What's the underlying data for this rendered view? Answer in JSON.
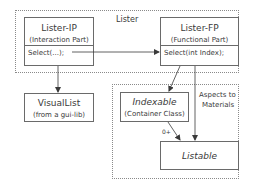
{
  "diagram": {
    "groups": [
      {
        "id": "lister",
        "label": "Lister"
      },
      {
        "id": "aspects",
        "label": "Aspects to Materials",
        "label_lines": [
          "Aspects to",
          "Materials"
        ]
      }
    ],
    "nodes": {
      "lister_ip": {
        "title": "Lister-IP",
        "subtitle": "(Interaction Part)",
        "method": "Select(...);"
      },
      "lister_fp": {
        "title": "Lister-FP",
        "subtitle": "(Functional Part)",
        "method": "Select(int Index);"
      },
      "visual_list": {
        "title": "VisualList",
        "subtitle": "(from a gui-lib)"
      },
      "indexable": {
        "title": "Indexable",
        "subtitle": "(Container Class)"
      },
      "listable": {
        "title": "Listable"
      }
    },
    "edges": [
      {
        "from": "lister_ip.Select(...)",
        "to": "lister_fp.Select(int Index)",
        "label": ""
      },
      {
        "from": "lister_ip",
        "to": "visual_list",
        "label": ""
      },
      {
        "from": "lister_fp",
        "to": "indexable",
        "label": ""
      },
      {
        "from": "lister_fp",
        "to": "listable",
        "label": ""
      },
      {
        "from": "indexable",
        "to": "listable",
        "label": "0+"
      }
    ],
    "multiplicity_label": "0+"
  }
}
